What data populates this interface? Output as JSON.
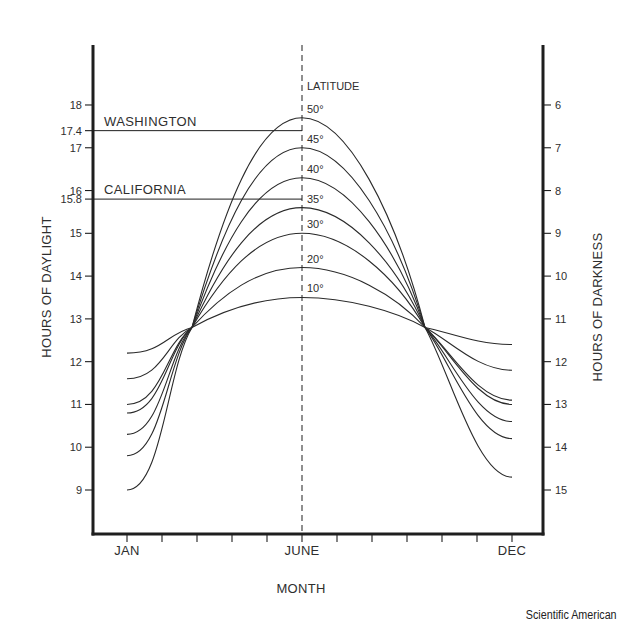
{
  "credit": "Scientific American",
  "chart_data": {
    "type": "line",
    "title": "",
    "xlabel": "MONTH",
    "ylabel": "HOURS OF DAYLIGHT",
    "ylabel_right": "HOURS OF DARKNESS",
    "x_tick_labels": [
      "JAN",
      "JUNE",
      "DEC"
    ],
    "x_months": [
      "JAN",
      "FEB",
      "MAR",
      "APR",
      "MAY",
      "JUNE",
      "JUL",
      "AUG",
      "SEP",
      "OCT",
      "NOV",
      "DEC"
    ],
    "y_ticks_left": [
      9,
      10,
      11,
      12,
      13,
      14,
      15,
      15.8,
      16,
      17,
      17.4,
      18
    ],
    "y_ticks_right": [
      6,
      7,
      8,
      9,
      10,
      11,
      12,
      13,
      14,
      15
    ],
    "ylim": [
      8,
      19
    ],
    "grid": false,
    "legend_title": "LATITUDE",
    "vertical_reference": "JUNE (dashed)",
    "annotations": [
      {
        "label": "WASHINGTON",
        "value": 17.4
      },
      {
        "label": "CALIFORNIA",
        "value": 15.8
      }
    ],
    "crossings": [
      {
        "month": "MAR (equinox)",
        "value": 12.8
      },
      {
        "month": "SEP (equinox)",
        "value": 12.8
      }
    ],
    "series": [
      {
        "name": "50°",
        "jan": 9.0,
        "equinox": 12.8,
        "june": 17.7,
        "dec": 9.3
      },
      {
        "name": "45°",
        "jan": 9.8,
        "equinox": 12.8,
        "june": 17.0,
        "dec": 10.2
      },
      {
        "name": "40°",
        "jan": 10.3,
        "equinox": 12.8,
        "june": 16.3,
        "dec": 10.6
      },
      {
        "name": "35°",
        "jan": 10.8,
        "equinox": 12.8,
        "june": 15.6,
        "dec": 11.0
      },
      {
        "name": "30°",
        "jan": 11.0,
        "equinox": 12.8,
        "june": 15.0,
        "dec": 11.1
      },
      {
        "name": "20°",
        "jan": 11.6,
        "equinox": 12.8,
        "june": 14.2,
        "dec": 11.8
      },
      {
        "name": "10°",
        "jan": 12.2,
        "equinox": 12.8,
        "june": 13.5,
        "dec": 12.4
      }
    ]
  }
}
